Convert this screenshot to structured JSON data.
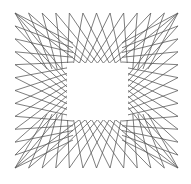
{
  "artwork": {
    "title": "",
    "description": "String-art square: straight lines crossing around a blank central square",
    "background": "#ffffff",
    "stroke_color": "#555555",
    "stroke_width": 0.9,
    "stroke_opacity": 0.85,
    "outer_box": {
      "x0": 15,
      "y0": 13,
      "x1": 178,
      "y1": 168
    },
    "inner_box": {
      "x0": 67,
      "y0": 63,
      "x1": 128,
      "y1": 120
    },
    "lines_per_side": 13
  }
}
